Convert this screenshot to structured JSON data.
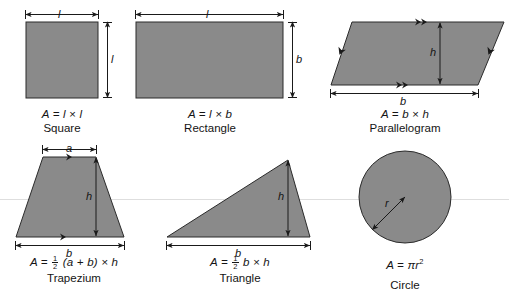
{
  "figure": {
    "background_color": "#ffffff",
    "shape_fill": "#8a8a8a",
    "shape_stroke": "#2b2b2b",
    "dimension_line_color": "#1a1a1a",
    "guide_line_color": "#d8d8d8"
  },
  "shapes": [
    {
      "id": "square",
      "name": "Square",
      "formula_prefix": "A = ",
      "formula_rest": "l × l",
      "dimensions": [
        {
          "symbol": "l",
          "position": "top"
        },
        {
          "symbol": "l",
          "position": "right"
        }
      ]
    },
    {
      "id": "rectangle",
      "name": "Rectangle",
      "formula_prefix": "A = ",
      "formula_rest": "l × b",
      "dimensions": [
        {
          "symbol": "l",
          "position": "top"
        },
        {
          "symbol": "b",
          "position": "right"
        }
      ]
    },
    {
      "id": "parallelogram",
      "name": "Parallelogram",
      "formula_prefix": "A = ",
      "formula_rest": "b × h",
      "dimensions": [
        {
          "symbol": "h",
          "position": "interior-vertical"
        },
        {
          "symbol": "b",
          "position": "bottom"
        }
      ]
    },
    {
      "id": "trapezium",
      "name": "Trapezium",
      "formula_prefix": "A = ",
      "formula_fraction_num": "1",
      "formula_fraction_den": "2",
      "formula_rest": "(a + b) × h",
      "dimensions": [
        {
          "symbol": "a",
          "position": "top"
        },
        {
          "symbol": "h",
          "position": "interior-vertical"
        },
        {
          "symbol": "b",
          "position": "bottom"
        }
      ]
    },
    {
      "id": "triangle",
      "name": "Triangle",
      "formula_prefix": "A = ",
      "formula_fraction_num": "1",
      "formula_fraction_den": "2",
      "formula_rest": "b × h",
      "dimensions": [
        {
          "symbol": "h",
          "position": "interior-vertical"
        },
        {
          "symbol": "b",
          "position": "bottom"
        }
      ]
    },
    {
      "id": "circle",
      "name": "Circle",
      "formula_prefix": "A = ",
      "formula_rest": "πr",
      "formula_exponent": "2",
      "dimensions": [
        {
          "symbol": "r",
          "position": "radius"
        }
      ]
    }
  ],
  "labels": {
    "square_top": "l",
    "square_right": "l",
    "rectangle_top": "l",
    "rectangle_right": "b",
    "parallelogram_h": "h",
    "parallelogram_b": "b",
    "trapezium_a": "a",
    "trapezium_h": "h",
    "trapezium_b": "b",
    "triangle_h": "h",
    "triangle_b": "b",
    "circle_r": "r"
  },
  "captions": {
    "square_formula_a": "A",
    "square_formula_eq": " = ",
    "square_name": "Square",
    "rectangle_name": "Rectangle",
    "parallelogram_name": "Parallelogram",
    "trapezium_name": "Trapezium",
    "triangle_name": "Triangle",
    "circle_name": "Circle"
  }
}
